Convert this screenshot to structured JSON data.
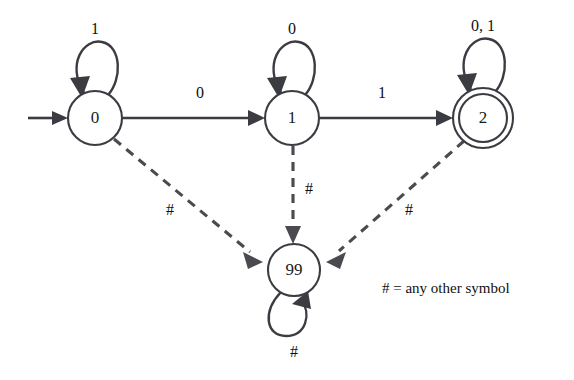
{
  "diagram": {
    "legend": "# = any other symbol",
    "background_color": "#ffffff",
    "line_color": "#3b3b42",
    "dashed_line_color": "#4a4a50",
    "text_color": "#101010"
  },
  "states": [
    {
      "id": "q0",
      "label": "0",
      "accepting": false,
      "start": true,
      "cx": 95,
      "cy": 118,
      "r": 27
    },
    {
      "id": "q1",
      "label": "1",
      "accepting": false,
      "start": false,
      "cx": 292,
      "cy": 118,
      "r": 27
    },
    {
      "id": "q2",
      "label": "2",
      "accepting": true,
      "start": false,
      "cx": 483,
      "cy": 118,
      "r": 30
    },
    {
      "id": "q99",
      "label": "99",
      "accepting": false,
      "start": false,
      "cx": 294,
      "cy": 270,
      "r": 26
    }
  ],
  "transitions": [
    {
      "from": "q0",
      "to": "q1",
      "label": "0",
      "style": "solid"
    },
    {
      "from": "q1",
      "to": "q2",
      "label": "1",
      "style": "solid"
    },
    {
      "from": "q0",
      "to": "q0",
      "label": "1",
      "style": "solid",
      "self_loop": true
    },
    {
      "from": "q1",
      "to": "q1",
      "label": "0",
      "style": "solid",
      "self_loop": true
    },
    {
      "from": "q2",
      "to": "q2",
      "label": "0, 1",
      "style": "solid",
      "self_loop": true
    },
    {
      "from": "q0",
      "to": "q99",
      "label": "#",
      "style": "dashed"
    },
    {
      "from": "q1",
      "to": "q99",
      "label": "#",
      "style": "dashed"
    },
    {
      "from": "q2",
      "to": "q99",
      "label": "#",
      "style": "dashed"
    },
    {
      "from": "q99",
      "to": "q99",
      "label": "#",
      "style": "solid",
      "self_loop": true
    }
  ],
  "labels": {
    "loop_q0": "1",
    "loop_q1": "0",
    "loop_q2": "0, 1",
    "loop_q99": "#",
    "edge_q0_q1": "0",
    "edge_q1_q2": "1",
    "edge_q0_q99": "#",
    "edge_q1_q99": "#",
    "edge_q2_q99": "#"
  }
}
